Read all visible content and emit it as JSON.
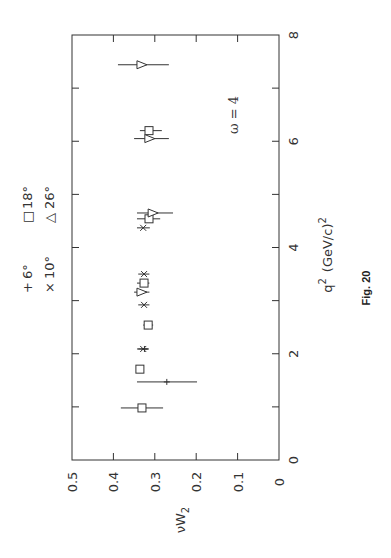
{
  "chart_data": {
    "type": "scatter",
    "orientation": "rotated 90 degrees counter-clockwise",
    "title": "",
    "xlabel": "q² (GeV/c)²",
    "ylabel": "νW₂",
    "xlim": [
      0,
      8
    ],
    "ylim": [
      0,
      0.5
    ],
    "xticks": [
      0,
      1,
      2,
      3,
      4,
      5,
      6,
      7,
      8
    ],
    "xtick_labels": [
      "0",
      "",
      "2",
      "",
      "4",
      "",
      "6",
      "",
      "8"
    ],
    "yticks": [
      0,
      0.1,
      0.2,
      0.3,
      0.4,
      0.5
    ],
    "ytick_labels": [
      "0",
      "0.1",
      "0.2",
      "0.3",
      "0.4",
      "0.5"
    ],
    "grid": false,
    "annotation": "ω = 4",
    "caption": "Fig. 20",
    "legend_position": "top",
    "series": [
      {
        "name": "6°",
        "marker": "plus",
        "symbol": "+",
        "points": [
          {
            "x": 1.47,
            "y": 0.271,
            "yerr_low": 0.198,
            "yerr_high": 0.343
          },
          {
            "x": 2.09,
            "y": 0.325,
            "yerr_low": 0.315,
            "yerr_high": 0.34
          }
        ]
      },
      {
        "name": "10°",
        "marker": "cross",
        "symbol": "×",
        "points": [
          {
            "x": 0.98,
            "y": 0.331,
            "yerr_low": 0.325,
            "yerr_high": 0.337
          },
          {
            "x": 2.09,
            "y": 0.328,
            "yerr_low": 0.315,
            "yerr_high": 0.343
          },
          {
            "x": 2.92,
            "y": 0.326,
            "yerr_low": 0.313,
            "yerr_high": 0.34
          },
          {
            "x": 3.5,
            "y": 0.326,
            "yerr_low": 0.313,
            "yerr_high": 0.34
          },
          {
            "x": 4.37,
            "y": 0.328,
            "yerr_low": 0.312,
            "yerr_high": 0.343
          }
        ]
      },
      {
        "name": "18°",
        "marker": "square",
        "symbol": "□",
        "points": [
          {
            "x": 0.98,
            "y": 0.331,
            "yerr_low": 0.28,
            "yerr_high": 0.382
          },
          {
            "x": 1.71,
            "y": 0.336,
            "yerr_low": 0.33,
            "yerr_high": 0.342
          },
          {
            "x": 2.54,
            "y": 0.316,
            "yerr_low": 0.304,
            "yerr_high": 0.328
          },
          {
            "x": 3.33,
            "y": 0.326,
            "yerr_low": 0.313,
            "yerr_high": 0.343
          },
          {
            "x": 4.54,
            "y": 0.314,
            "yerr_low": 0.287,
            "yerr_high": 0.343
          },
          {
            "x": 6.2,
            "y": 0.314,
            "yerr_low": 0.283,
            "yerr_high": 0.336
          }
        ]
      },
      {
        "name": "26°",
        "marker": "triangle",
        "symbol": "△",
        "points": [
          {
            "x": 3.16,
            "y": 0.331,
            "yerr_low": 0.313,
            "yerr_high": 0.35
          },
          {
            "x": 4.65,
            "y": 0.304,
            "yerr_low": 0.256,
            "yerr_high": 0.343
          },
          {
            "x": 6.05,
            "y": 0.312,
            "yerr_low": 0.266,
            "yerr_high": 0.35
          },
          {
            "x": 7.44,
            "y": 0.331,
            "yerr_low": 0.266,
            "yerr_high": 0.389
          }
        ]
      }
    ]
  },
  "legend": [
    {
      "symbol": "+",
      "label": "6°"
    },
    {
      "symbol": "×",
      "label": "10°"
    },
    {
      "symbol": "□",
      "label": "18°"
    },
    {
      "symbol": "△",
      "label": "26°"
    }
  ],
  "labels": {
    "xlabel_base": "q",
    "xlabel_sup": "2",
    "xlabel_rest": "(GeV/c)",
    "xlabel_sup2": "2",
    "ylabel_base": "νW",
    "ylabel_sub": "2",
    "annotation": "ω = 4",
    "caption": "Fig.  20"
  }
}
